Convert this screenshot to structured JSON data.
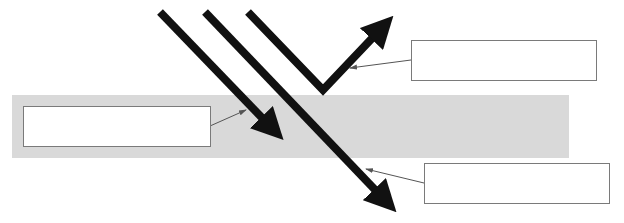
{
  "diagram": {
    "medium": {
      "x": 12,
      "y": 95,
      "width": 557,
      "height": 63,
      "color": "#d9d9d9"
    },
    "colors": {
      "ray": "#111111",
      "leader": "#555555",
      "box_border": "#7a7a7a"
    },
    "label_boxes": [
      {
        "id": "absorbed",
        "x": 23,
        "y": 106,
        "width": 188,
        "height": 41,
        "text": ""
      },
      {
        "id": "reflected",
        "x": 411,
        "y": 40,
        "width": 186,
        "height": 41,
        "text": ""
      },
      {
        "id": "transmitted",
        "x": 424,
        "y": 163,
        "width": 186,
        "height": 41,
        "text": ""
      }
    ],
    "rays": [
      {
        "id": "absorbed-ray",
        "points": [
          [
            160,
            12
          ],
          [
            282,
            138
          ]
        ]
      },
      {
        "id": "transmitted-ray",
        "points": [
          [
            205,
            12
          ],
          [
            395,
            210
          ]
        ]
      },
      {
        "id": "reflected-ray",
        "points": [
          [
            248,
            12
          ],
          [
            323,
            90
          ],
          [
            392,
            18
          ]
        ]
      }
    ]
  }
}
